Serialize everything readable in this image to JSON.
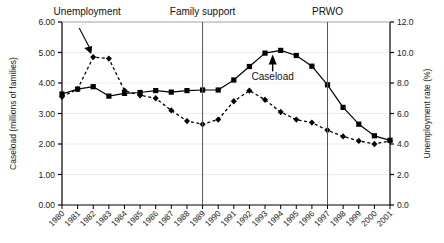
{
  "chart_data": {
    "type": "line",
    "title": "",
    "xlabel": "",
    "ylabel": "Caseload (millions of families)",
    "y2label": "Unemployment rate (%)",
    "x": [
      "1980",
      "1981",
      "1982",
      "1983",
      "1984",
      "1985",
      "1986",
      "1987",
      "1988",
      "1989",
      "1990",
      "1991",
      "1992",
      "1993",
      "1994",
      "1995",
      "1996",
      "1997",
      "1998",
      "1999",
      "2000",
      "2001"
    ],
    "xtick_labels": [
      "1980",
      "1981",
      "1982",
      "1983",
      "1984",
      "1985",
      "1986",
      "1987",
      "1988",
      "1989",
      "1990",
      "1991",
      "1992",
      "1993",
      "1994",
      "1995",
      "1996",
      "1997",
      "1998",
      "1999",
      "2000",
      "2001"
    ],
    "ylim": [
      0.0,
      6.0
    ],
    "yticks": [
      "0.00",
      "1.00",
      "2.00",
      "3.00",
      "4.00",
      "5.00",
      "6.00"
    ],
    "ytick_values": [
      0.0,
      1.0,
      2.0,
      3.0,
      4.0,
      5.0,
      6.0
    ],
    "y2lim": [
      0.0,
      12.0
    ],
    "y2ticks": [
      "0.0",
      "2.0",
      "4.0",
      "6.0",
      "8.0",
      "10.0",
      "12.0"
    ],
    "y2tick_values": [
      0.0,
      2.0,
      4.0,
      6.0,
      8.0,
      10.0,
      12.0
    ],
    "grid": false,
    "legend": "none",
    "series": [
      {
        "name": "Caseload",
        "axis": "left",
        "marker": "square",
        "line_style": "solid",
        "color": "#000000",
        "values": [
          3.64,
          3.8,
          3.88,
          3.57,
          3.66,
          3.69,
          3.75,
          3.7,
          3.75,
          3.77,
          3.77,
          4.1,
          4.54,
          4.98,
          5.07,
          4.9,
          4.55,
          3.94,
          3.2,
          2.65,
          2.27,
          2.12
        ]
      },
      {
        "name": "Unemployment",
        "axis": "right",
        "marker": "diamond",
        "line_style": "dashed",
        "color": "#000000",
        "values": [
          7.1,
          7.6,
          9.7,
          9.6,
          7.5,
          7.2,
          7.0,
          6.2,
          5.5,
          5.3,
          5.6,
          6.8,
          7.5,
          6.9,
          6.1,
          5.6,
          5.4,
          4.9,
          4.5,
          4.2,
          4.0,
          4.2
        ]
      }
    ],
    "annotations": [
      {
        "id": "unemployment-annotation",
        "text": "Unemployment",
        "x_year": "1982",
        "style": "arrow-down-right"
      },
      {
        "id": "caseload-annotation",
        "text": "Caseload",
        "x_year": "1994",
        "style": "arrow-up"
      },
      {
        "id": "family-support-marker",
        "text": "Family support",
        "x_year": "1989",
        "style": "vline"
      },
      {
        "id": "prwo-marker",
        "text": "PRWO",
        "x_year": "1997",
        "style": "vline"
      }
    ],
    "vertical_markers": [
      {
        "label": "Family support",
        "x_year": "1989"
      },
      {
        "label": "PRWO",
        "x_year": "1997"
      }
    ]
  }
}
